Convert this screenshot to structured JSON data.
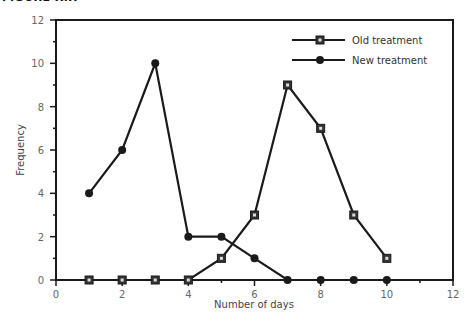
{
  "figure": {
    "title": "FIGURE X.X"
  },
  "chart_data": {
    "type": "line",
    "title": "",
    "xlabel": "Number of days",
    "ylabel": "Frequency",
    "xlim": [
      0,
      12
    ],
    "ylim": [
      0,
      12
    ],
    "x_ticks": [
      0,
      2,
      4,
      6,
      8,
      10,
      12
    ],
    "y_ticks": [
      0,
      2,
      4,
      6,
      8,
      10,
      12
    ],
    "grid": false,
    "legend_position": "upper right",
    "x": [
      1,
      2,
      3,
      4,
      5,
      6,
      7,
      8,
      9,
      10
    ],
    "series": [
      {
        "name": "Old treatment",
        "marker": "square",
        "values": [
          0,
          0,
          0,
          0,
          1,
          3,
          9,
          7,
          3,
          1
        ]
      },
      {
        "name": "New treatment",
        "marker": "circle",
        "values": [
          4,
          6,
          10,
          2,
          2,
          1,
          0,
          0,
          0,
          0
        ]
      }
    ]
  },
  "colors": {
    "line": "#1a1a1a",
    "frame": "#1a1a1a",
    "tick_text": "#666666"
  }
}
